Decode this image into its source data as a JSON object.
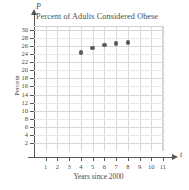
{
  "chart_data": {
    "type": "scatter",
    "title": "Percent of Adults Considered Obese",
    "xlabel": "Years since 2000",
    "ylabel": "Percent",
    "x_axis_variable": "t",
    "y_axis_variable": "P",
    "x": [
      4,
      5,
      6,
      7,
      8
    ],
    "values": [
      24.5,
      25.5,
      26.3,
      26.6,
      26.9
    ],
    "points": [
      {
        "x": 4,
        "y": 24.5
      },
      {
        "x": 5,
        "y": 25.5
      },
      {
        "x": 6,
        "y": 26.3
      },
      {
        "x": 7,
        "y": 26.6
      },
      {
        "x": 8,
        "y": 26.9
      }
    ],
    "xlim": [
      0,
      11
    ],
    "ylim": [
      0,
      31
    ],
    "xticks": [
      1,
      2,
      3,
      4,
      5,
      6,
      7,
      8,
      9,
      10,
      11
    ],
    "yticks": [
      2,
      4,
      6,
      8,
      10,
      12,
      14,
      16,
      18,
      20,
      22,
      24,
      26,
      28,
      30
    ],
    "xtick_labels": [
      "1",
      "2",
      "3",
      "4",
      "5",
      "6",
      "7",
      "8",
      "9",
      "10",
      "11"
    ],
    "ytick_labels": [
      "2",
      "4",
      "6",
      "8",
      "10",
      "12",
      "14",
      "16",
      "18",
      "20",
      "22",
      "24",
      "26",
      "28",
      "30"
    ],
    "grid": true,
    "legend": null,
    "marker_color": "#5a5a60",
    "grid_color": "#d8d8dc",
    "axis_color": "#555558"
  }
}
